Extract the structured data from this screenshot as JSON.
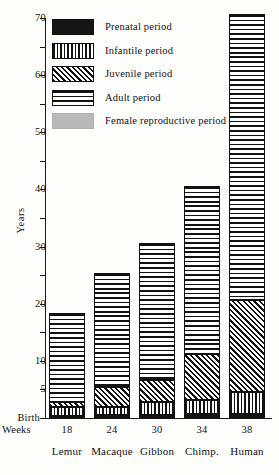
{
  "figure": {
    "y_axis_title": "Years",
    "birth_label": "Birth",
    "weeks_caption": "Weeks"
  },
  "legend": {
    "items": [
      {
        "label": "Prenatal period",
        "pattern": "solid-black",
        "key": "prenatal"
      },
      {
        "label": "Infantile period",
        "pattern": "vertical-stripes",
        "key": "infantile"
      },
      {
        "label": "Juvenile period",
        "pattern": "diagonal-hatch",
        "key": "juvenile"
      },
      {
        "label": "Adult period",
        "pattern": "horizontal-stripes",
        "key": "adult"
      },
      {
        "label": "Female reproductive period",
        "pattern": "solid-grey",
        "key": "female"
      }
    ]
  },
  "chart_data": {
    "type": "bar",
    "title": "",
    "subtitle": "",
    "xlabel": "",
    "ylabel": "Years",
    "ylim": [
      0,
      70
    ],
    "yticks": [
      0,
      5,
      10,
      15,
      20,
      25,
      30,
      35,
      40,
      45,
      50,
      55,
      60,
      65,
      70
    ],
    "ytick_labels": [
      "Birth",
      "5",
      "10",
      "",
      "20",
      "",
      "30",
      "",
      "40",
      "",
      "50",
      "",
      "60",
      "",
      "70"
    ],
    "grid": false,
    "legend_position": "upper-left",
    "stacked": true,
    "categories": [
      "Lemur",
      "Macaque",
      "Gibbon",
      "Chimp.",
      "Human"
    ],
    "gestation_weeks": [
      18,
      24,
      30,
      34,
      38
    ],
    "series": [
      {
        "name": "Prenatal period",
        "key": "prenatal",
        "values": [
          0.35,
          0.46,
          0.58,
          0.65,
          0.73
        ]
      },
      {
        "name": "Infantile period",
        "key": "infantile",
        "values": [
          1.6,
          1.5,
          2.2,
          2.5,
          3.8
        ]
      },
      {
        "name": "Juvenile period",
        "key": "juvenile",
        "values": [
          0.9,
          3.5,
          3.8,
          8.0,
          16.2
        ]
      },
      {
        "name": "Adult period",
        "key": "adult",
        "values": [
          15.5,
          20.0,
          24.0,
          29.5,
          50.0
        ]
      }
    ],
    "totals": [
      18,
      25,
      30,
      40,
      70
    ],
    "annotations": [
      "Birth marks the zero point of the year axis",
      "Weeks row gives gestation length in weeks"
    ]
  }
}
